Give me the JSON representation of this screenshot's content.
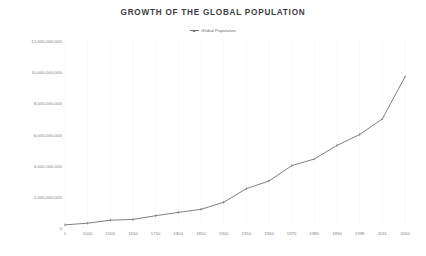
{
  "chart_data": {
    "type": "line",
    "title": "GROWTH OF THE GLOBAL POPULATION",
    "xlabel": "",
    "ylabel": "",
    "grid": true,
    "legend_position": "top-center",
    "legend": [
      "Global Population"
    ],
    "categories": [
      "1",
      "1000",
      "1500",
      "1650",
      "1750",
      "1804",
      "1850",
      "1900",
      "1950",
      "1960",
      "1975",
      "1980",
      "1990",
      "1999",
      "2011",
      "2050"
    ],
    "series": [
      {
        "name": "Global Population",
        "values": [
          200000000,
          310000000,
          500000000,
          550000000,
          790000000,
          1000000000,
          1200000000,
          1650000000,
          2520000000,
          3020000000,
          4000000000,
          4430000000,
          5300000000,
          6000000000,
          7000000000,
          9700000000
        ]
      }
    ],
    "ylim": [
      0,
      12000000000
    ],
    "ytick_labels": [
      "12,000,000,000",
      "10,000,000,000",
      "8,000,000,000",
      "6,000,000,000",
      "4,000,000,000",
      "2,000,000,000",
      "0"
    ],
    "ytick_values": [
      12000000000,
      10000000000,
      8000000000,
      6000000000,
      4000000000,
      2000000000,
      0
    ],
    "line_color": "#6e7073",
    "background_color": "#ffffff",
    "gridline_color": "#fafafa"
  }
}
